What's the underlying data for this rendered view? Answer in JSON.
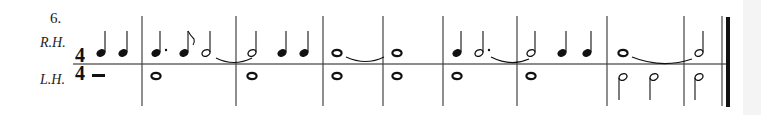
{
  "exercise": {
    "number": "6.",
    "right_hand_label": "R.H.",
    "left_hand_label": "L.H.",
    "time_signature": {
      "top": "4",
      "bottom": "4"
    }
  },
  "colors": {
    "ink": "#1a1a1a",
    "staff": "#555555",
    "background": "#ffffff"
  },
  "measures": [
    {
      "index": 0,
      "type": "pickup",
      "rh": [
        "quarter",
        "quarter"
      ],
      "lh": [
        "half-rest"
      ]
    },
    {
      "index": 1,
      "rh": [
        "dotted-quarter",
        "eighth",
        "half (tied)"
      ],
      "lh": [
        "whole"
      ]
    },
    {
      "index": 2,
      "rh": [
        "half",
        "quarter",
        "quarter"
      ],
      "lh": [
        "whole"
      ]
    },
    {
      "index": 3,
      "rh": [
        "whole (tied)"
      ],
      "lh": [
        "whole"
      ]
    },
    {
      "index": 4,
      "rh": [
        "whole"
      ],
      "lh": [
        "whole"
      ]
    },
    {
      "index": 5,
      "rh": [
        "quarter",
        "dotted-half (tied)"
      ],
      "lh": [
        "whole"
      ]
    },
    {
      "index": 6,
      "rh": [
        "half",
        "quarter",
        "quarter"
      ],
      "lh": [
        "whole"
      ]
    },
    {
      "index": 7,
      "rh": [
        "whole (tied)"
      ],
      "lh": [
        "half",
        "half"
      ]
    },
    {
      "index": 8,
      "rh": [
        "half"
      ],
      "lh": [
        "half"
      ],
      "ending": "final-barline"
    }
  ]
}
